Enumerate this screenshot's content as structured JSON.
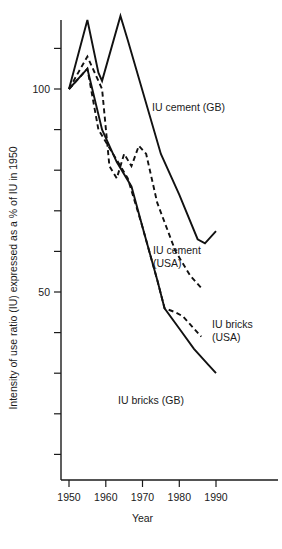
{
  "chart_data": {
    "type": "line",
    "title": "",
    "xlabel": "Year",
    "ylabel": "Intensity of use ratio (IU) expressed as a % of IU in 1950",
    "xlim": [
      1946,
      1996
    ],
    "ylim": [
      0,
      127
    ],
    "xticks": [
      1950,
      1960,
      1970,
      1980,
      1990
    ],
    "xticklabels": [
      "1950",
      "1960",
      "1970",
      "1980",
      "1990"
    ],
    "yticks": [
      10,
      20,
      30,
      40,
      50,
      60,
      70,
      80,
      90,
      100,
      110
    ],
    "yticklabels": [
      "",
      "",
      "",
      "",
      "50",
      "",
      "",
      "",
      "",
      "100",
      ""
    ],
    "grid": false,
    "legend": "inline-annotations",
    "series": [
      {
        "name": "IU cement (GB)",
        "style": "solid",
        "label_x": 1973,
        "label_y": 95,
        "points": [
          [
            1950,
            100
          ],
          [
            1955,
            117
          ],
          [
            1958,
            104
          ],
          [
            1959,
            102
          ],
          [
            1964,
            118
          ],
          [
            1966,
            112
          ],
          [
            1975,
            84
          ],
          [
            1980,
            74
          ],
          [
            1985,
            63
          ],
          [
            1987,
            62
          ],
          [
            1990,
            65
          ]
        ]
      },
      {
        "name": "IU cement (USA)",
        "style": "dashed",
        "label_x": 1968,
        "label_y": 60,
        "label_line2": "(USA)",
        "points": [
          [
            1950,
            100
          ],
          [
            1955,
            108
          ],
          [
            1957,
            104
          ],
          [
            1959,
            100
          ],
          [
            1961,
            81
          ],
          [
            1963,
            78
          ],
          [
            1965,
            84
          ],
          [
            1967,
            81
          ],
          [
            1969,
            86
          ],
          [
            1971,
            84
          ],
          [
            1974,
            72
          ],
          [
            1979,
            60
          ],
          [
            1983,
            54
          ],
          [
            1986,
            51
          ]
        ]
      },
      {
        "name": "IU bricks (USA)",
        "style": "dashed",
        "label_x": 1981,
        "label_y": 45,
        "label_line2": "(USA)",
        "points": [
          [
            1950,
            100
          ],
          [
            1955,
            105
          ],
          [
            1958,
            90
          ],
          [
            1962,
            84
          ],
          [
            1966,
            78
          ],
          [
            1970,
            66
          ],
          [
            1974,
            53
          ],
          [
            1976,
            46
          ],
          [
            1979,
            45
          ],
          [
            1981,
            44
          ],
          [
            1984,
            41
          ],
          [
            1986,
            39
          ]
        ]
      },
      {
        "name": "IU bricks (GB)",
        "style": "solid",
        "label_x": 1966,
        "label_y": 34,
        "points": [
          [
            1950,
            100
          ],
          [
            1955,
            105
          ],
          [
            1959,
            90
          ],
          [
            1963,
            82
          ],
          [
            1967,
            76
          ],
          [
            1970,
            66
          ],
          [
            1974,
            53
          ],
          [
            1976,
            46
          ],
          [
            1980,
            41
          ],
          [
            1984,
            36
          ],
          [
            1988,
            32
          ],
          [
            1990,
            30
          ]
        ]
      }
    ],
    "annotations": [
      {
        "id": "cement-gb",
        "text": "IU cement (GB)",
        "lines": [
          "IU cement (GB)"
        ],
        "x": 152,
        "y": 111
      },
      {
        "id": "cement-usa",
        "text": "IU cement (USA)",
        "lines": [
          "IU cement",
          "(USA)"
        ],
        "x": 153,
        "y": 254
      },
      {
        "id": "bricks-usa",
        "text": "IU bricks (USA)",
        "lines": [
          "IU bricks",
          "(USA)"
        ],
        "x": 212,
        "y": 328
      },
      {
        "id": "bricks-gb",
        "text": "IU bricks (GB)",
        "lines": [
          "IU bricks (GB)"
        ],
        "x": 118,
        "y": 404
      }
    ]
  }
}
